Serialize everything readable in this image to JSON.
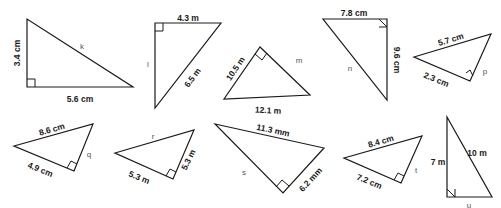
{
  "triangles": [
    {
      "id": "k",
      "points": [
        [
          27,
          19
        ],
        [
          27,
          87
        ],
        [
          133,
          87
        ]
      ],
      "right_angle": {
        "corner": [
          27,
          87
        ],
        "a": [
          27,
          79
        ],
        "b": [
          35,
          87
        ],
        "c": [
          35,
          79
        ]
      },
      "labels": [
        {
          "text": "3.4 cm",
          "x": 18,
          "y": 53,
          "rot": -90,
          "cls": "lbl"
        },
        {
          "text": "5.6 cm",
          "x": 80,
          "y": 100,
          "rot": 0,
          "cls": "lbl"
        },
        {
          "text": "k",
          "x": 82,
          "y": 47,
          "rot": 0,
          "cls": "var"
        }
      ]
    },
    {
      "id": "l",
      "points": [
        [
          155,
          23
        ],
        [
          155,
          108
        ],
        [
          221,
          23
        ]
      ],
      "right_angle": {
        "a": [
          155,
          31
        ],
        "b": [
          163,
          23
        ],
        "c": [
          163,
          31
        ]
      },
      "labels": [
        {
          "text": "4.3 m",
          "x": 188,
          "y": 19,
          "rot": 0,
          "cls": "lbl"
        },
        {
          "text": "l",
          "x": 148,
          "y": 65,
          "rot": 0,
          "cls": "var"
        },
        {
          "text": "6.5 m",
          "x": 193,
          "y": 78,
          "rot": -54,
          "cls": "lbl"
        }
      ]
    },
    {
      "id": "m",
      "points": [
        [
          224,
          99
        ],
        [
          260,
          47
        ],
        [
          310,
          95
        ]
      ],
      "right_angle": {
        "a": [
          255,
          54
        ],
        "b": [
          267,
          53
        ],
        "c": [
          262,
          60
        ]
      },
      "labels": [
        {
          "text": "10.5 m",
          "x": 236,
          "y": 69,
          "rot": -56,
          "cls": "lbl"
        },
        {
          "text": "m",
          "x": 299,
          "y": 61,
          "rot": 0,
          "cls": "var"
        },
        {
          "text": "12.1 m",
          "x": 268,
          "y": 111,
          "rot": 3,
          "cls": "lbl"
        }
      ]
    },
    {
      "id": "n",
      "points": [
        [
          323,
          19
        ],
        [
          387,
          19
        ],
        [
          387,
          100
        ]
      ],
      "right_angle": {
        "a": [
          379,
          19
        ],
        "b": [
          379,
          27
        ],
        "c": [
          387,
          27
        ]
      },
      "labels": [
        {
          "text": "7.8 cm",
          "x": 354,
          "y": 14,
          "rot": 0,
          "cls": "lbl"
        },
        {
          "text": "9.6 cm",
          "x": 396,
          "y": 60,
          "rot": 90,
          "cls": "lbl"
        },
        {
          "text": "n",
          "x": 350,
          "y": 69,
          "rot": 0,
          "cls": "var"
        }
      ]
    },
    {
      "id": "p",
      "points": [
        [
          414,
          57
        ],
        [
          491,
          34
        ],
        [
          470,
          81
        ]
      ],
      "right_angle": {
        "a": [
          466,
          73
        ],
        "b": [
          473,
          76
        ],
        "c": [
          470,
          70
        ]
      },
      "labels": [
        {
          "text": "5.7 cm",
          "x": 451,
          "y": 40,
          "rot": -17,
          "cls": "lbl"
        },
        {
          "text": "2.3 cm",
          "x": 436,
          "y": 80,
          "rot": 22,
          "cls": "lbl"
        },
        {
          "text": "p",
          "x": 485,
          "y": 72,
          "rot": 0,
          "cls": "var"
        }
      ]
    },
    {
      "id": "q",
      "points": [
        [
          14,
          146
        ],
        [
          93,
          124
        ],
        [
          74,
          171
        ]
      ],
      "right_angle": {
        "a": [
          67,
          168
        ],
        "b": [
          77,
          164
        ],
        "c": [
          71,
          161
        ]
      },
      "labels": [
        {
          "text": "8.6 cm",
          "x": 52,
          "y": 130,
          "rot": -16,
          "cls": "lbl"
        },
        {
          "text": "4.9 cm",
          "x": 40,
          "y": 170,
          "rot": 22,
          "cls": "lbl"
        },
        {
          "text": "q",
          "x": 89,
          "y": 155,
          "rot": 0,
          "cls": "var"
        }
      ]
    },
    {
      "id": "r",
      "points": [
        [
          115,
          153
        ],
        [
          194,
          130
        ],
        [
          173,
          179
        ]
      ],
      "right_angle": {
        "a": [
          166,
          176
        ],
        "b": [
          176,
          172
        ],
        "c": [
          170,
          169
        ]
      },
      "labels": [
        {
          "text": "r",
          "x": 153,
          "y": 137,
          "rot": 0,
          "cls": "var"
        },
        {
          "text": "5.3 m",
          "x": 139,
          "y": 178,
          "rot": 22,
          "cls": "lbl"
        },
        {
          "text": "5.3 m",
          "x": 189,
          "y": 160,
          "rot": -64,
          "cls": "lbl"
        }
      ]
    },
    {
      "id": "s",
      "points": [
        [
          215,
          124
        ],
        [
          324,
          148
        ],
        [
          283,
          193
        ]
      ],
      "right_angle": {
        "a": [
          276,
          187
        ],
        "b": [
          289,
          186
        ],
        "c": [
          282,
          180
        ]
      },
      "labels": [
        {
          "text": "11.3 mm",
          "x": 273,
          "y": 131,
          "rot": 12,
          "cls": "lbl"
        },
        {
          "text": "s",
          "x": 244,
          "y": 173,
          "rot": 0,
          "cls": "var"
        },
        {
          "text": "6.2 mm",
          "x": 311,
          "y": 180,
          "rot": -47,
          "cls": "lbl"
        }
      ]
    },
    {
      "id": "t",
      "points": [
        [
          344,
          158
        ],
        [
          422,
          136
        ],
        [
          401,
          183
        ]
      ],
      "right_angle": {
        "a": [
          394,
          180
        ],
        "b": [
          404,
          176
        ],
        "c": [
          398,
          173
        ]
      },
      "labels": [
        {
          "text": "8.4 cm",
          "x": 381,
          "y": 142,
          "rot": -16,
          "cls": "lbl"
        },
        {
          "text": "7.2 cm",
          "x": 369,
          "y": 182,
          "rot": 22,
          "cls": "lbl"
        },
        {
          "text": "t",
          "x": 416,
          "y": 171,
          "rot": 0,
          "cls": "var"
        }
      ]
    },
    {
      "id": "u",
      "points": [
        [
          447,
          117
        ],
        [
          447,
          197
        ],
        [
          492,
          197
        ]
      ],
      "right_angle": {
        "a": [
          447,
          189
        ],
        "b": [
          455,
          189
        ],
        "c": [
          455,
          197
        ]
      },
      "labels": [
        {
          "text": "7 m",
          "x": 438,
          "y": 163,
          "rot": 0,
          "cls": "lbl"
        },
        {
          "text": "10 m",
          "x": 477,
          "y": 154,
          "rot": 0,
          "cls": "lbl"
        },
        {
          "text": "u",
          "x": 469,
          "y": 206,
          "rot": 0,
          "cls": "var"
        }
      ]
    }
  ]
}
